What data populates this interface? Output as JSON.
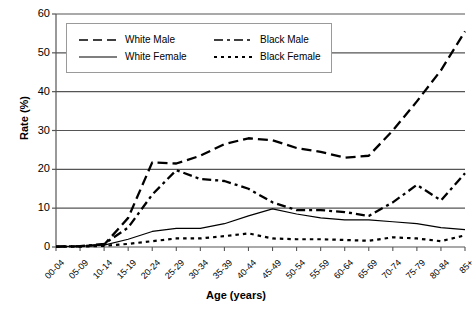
{
  "chart_data": {
    "type": "line",
    "title": "",
    "xlabel": "Age (years)",
    "ylabel": "Rate (%)",
    "ylim": [
      0,
      60
    ],
    "yticks": [
      0,
      10,
      20,
      30,
      40,
      50,
      60
    ],
    "grid": "horizontal",
    "legend_position": "top-inside",
    "categories": [
      "00-04",
      "05-09",
      "10-14",
      "15-19",
      "20-24",
      "25-29",
      "30-34",
      "35-39",
      "40-44",
      "45-49",
      "50-54",
      "55-59",
      "60-64",
      "65-69",
      "70-74",
      "75-79",
      "80-84",
      "85+"
    ],
    "series": [
      {
        "name": "White Male",
        "style": "dashed",
        "values": [
          0.1,
          0.2,
          0.6,
          7.5,
          21.8,
          21.5,
          23.5,
          26.5,
          28.0,
          27.5,
          25.5,
          24.5,
          23.0,
          23.5,
          30.0,
          37.5,
          45.5,
          55.5
        ]
      },
      {
        "name": "White Female",
        "style": "solid",
        "values": [
          0.1,
          0.2,
          0.5,
          2.0,
          4.0,
          4.8,
          4.8,
          6.0,
          8.0,
          9.8,
          8.5,
          7.5,
          7.0,
          7.0,
          6.5,
          6.0,
          5.0,
          4.5
        ]
      },
      {
        "name": "Black Male",
        "style": "dash-dot",
        "values": [
          0.1,
          0.2,
          0.8,
          5.0,
          13.5,
          19.8,
          17.5,
          17.0,
          15.0,
          11.5,
          9.5,
          9.5,
          9.0,
          8.0,
          11.5,
          16.0,
          12.0,
          19.0
        ]
      },
      {
        "name": "Black Female",
        "style": "dotted",
        "values": [
          0.1,
          0.1,
          0.3,
          0.8,
          1.5,
          2.2,
          2.2,
          2.8,
          3.5,
          2.2,
          2.0,
          2.0,
          1.8,
          1.6,
          2.5,
          2.2,
          1.5,
          3.0
        ]
      }
    ]
  },
  "legend": {
    "items": [
      {
        "label": "White Male",
        "style": "dashed"
      },
      {
        "label": "Black Male",
        "style": "dash-dot"
      },
      {
        "label": "White Female",
        "style": "solid"
      },
      {
        "label": "Black Female",
        "style": "dotted"
      }
    ]
  }
}
